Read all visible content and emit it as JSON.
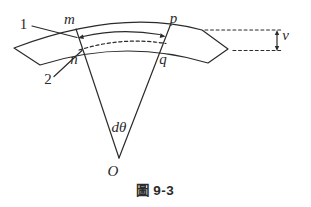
{
  "figure": {
    "caption": "圖 9-3",
    "labels": {
      "callout_1": "1",
      "callout_2": "2",
      "point_m": "m",
      "point_n": "n",
      "point_p": "p",
      "point_q": "q",
      "angle_dtheta": "dθ",
      "center_O": "O",
      "offset_v": "v"
    },
    "colors": {
      "ink": "#2b2b2b",
      "paper": "#ffffff"
    }
  }
}
